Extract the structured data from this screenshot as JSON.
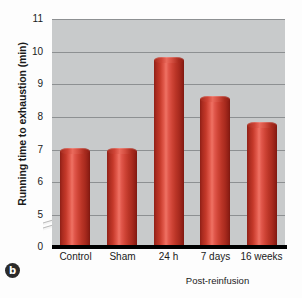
{
  "panel": {
    "letter": "b"
  },
  "chart_data": {
    "type": "bar",
    "title": "",
    "xlabel": "",
    "ylabel": "Running time to exhaustion (min)",
    "categories": [
      "Control",
      "Sham",
      "24 h",
      "7 days",
      "16 weeks"
    ],
    "values": [
      6.95,
      6.95,
      9.75,
      8.55,
      7.75
    ],
    "ylim": [
      0,
      11
    ],
    "yticks": [
      11,
      10,
      9,
      8,
      7,
      6,
      5,
      0
    ],
    "ytick_labels": [
      "11",
      "10",
      "9",
      "8",
      "7",
      "6",
      "5",
      "0"
    ],
    "axis_break": true,
    "axis_break_between": [
      5,
      0
    ],
    "grid": true,
    "grid_axis": "y",
    "legend": "none",
    "annotations": [
      {
        "text": "Post-reinfusion",
        "spans_categories": [
          "24 h",
          "7 days",
          "16 weeks"
        ],
        "style": "bracket-below-axis"
      }
    ],
    "colors": {
      "bar_dark": "#8e1f16",
      "bar_mid": "#c5392a",
      "bar_highlight": "#ef7264",
      "plot_background": "#c8cacb",
      "gridline": "#8d9092",
      "baseline": "#000000",
      "text": "#1a1a1a"
    },
    "bar_style": "3d-cylinder"
  }
}
